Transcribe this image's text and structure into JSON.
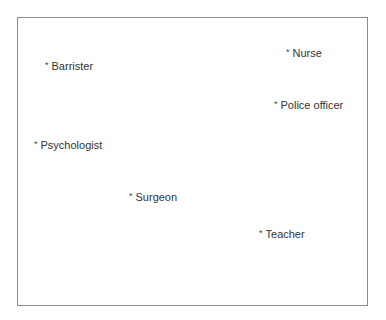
{
  "diagram": {
    "type": "perceptual-map",
    "items": [
      {
        "marker": "*",
        "label": "Barrister",
        "x": 45,
        "y": 67
      },
      {
        "marker": "*",
        "label": "Nurse",
        "x": 286,
        "y": 54
      },
      {
        "marker": "*",
        "label": "Police officer",
        "x": 274,
        "y": 106
      },
      {
        "marker": "*",
        "label": "Psychologist",
        "x": 34,
        "y": 146
      },
      {
        "marker": "*",
        "label": "Surgeon",
        "x": 129,
        "y": 198
      },
      {
        "marker": "*",
        "label": "Teacher",
        "x": 259,
        "y": 235
      }
    ]
  }
}
